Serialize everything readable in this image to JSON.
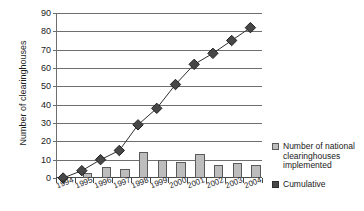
{
  "chart_data": {
    "type": "bar",
    "title": "",
    "xlabel": "",
    "ylabel": "Number of clearinghouses",
    "ylim": [
      0,
      90
    ],
    "ytick_step": 10,
    "yticks": [
      0,
      10,
      20,
      30,
      40,
      50,
      60,
      70,
      80,
      90
    ],
    "grid": true,
    "legend_position": "right",
    "categories": [
      "1994",
      "1995",
      "1996",
      "1997",
      "1998",
      "1999",
      "2000",
      "2001",
      "2002",
      "2003",
      "2004"
    ],
    "series": [
      {
        "name": "Number of national clearinghouses implemented",
        "type": "bar",
        "color": "#bdbdbd",
        "values": [
          0,
          3,
          6,
          5,
          14,
          10,
          9,
          13,
          7,
          8,
          7
        ]
      },
      {
        "name": "Cumulative",
        "type": "line",
        "color": "#474747",
        "marker": "diamond",
        "values": [
          0,
          4,
          10,
          15,
          29,
          38,
          51,
          62,
          68,
          75,
          82
        ]
      }
    ]
  },
  "axes": {
    "y_title": "Number of clearinghouses"
  },
  "legend": {
    "items": [
      {
        "label": "Number of national clearinghouses implemented",
        "swatch": "bar-swatch",
        "color": "#bdbdbd"
      },
      {
        "label": "Cumulative",
        "swatch": "cumulative-swatch",
        "color": "#474747"
      }
    ]
  }
}
